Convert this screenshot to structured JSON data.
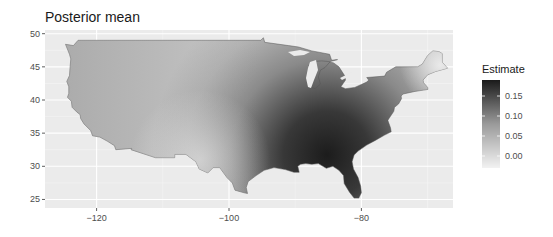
{
  "chart_data": {
    "type": "heatmap",
    "subtype": "choropleth-map",
    "title": "Posterior mean",
    "xlabel": "",
    "ylabel": "",
    "x_ticks": [
      -120,
      -100,
      -80
    ],
    "y_ticks": [
      25,
      30,
      35,
      40,
      45,
      50
    ],
    "xlim": [
      -127,
      -65
    ],
    "ylim": [
      24,
      50.5
    ],
    "grid": true,
    "region": "Contiguous United States",
    "legend": {
      "title": "Estimate",
      "position": "right",
      "labels": [
        "0.15",
        "0.10",
        "0.05",
        "0.00"
      ],
      "values": [
        0.15,
        0.1,
        0.05,
        0.0
      ],
      "range": [
        -0.03,
        0.19
      ],
      "colors": {
        "low": "#f2f2f2",
        "high": "#1a1a1a"
      }
    },
    "spatial_pattern": [
      {
        "area": "Pacific Northwest",
        "lon": -120,
        "lat": 46,
        "estimate": 0.06
      },
      {
        "area": "California coast",
        "lon": -121,
        "lat": 37,
        "estimate": 0.04
      },
      {
        "area": "Great Basin",
        "lon": -115,
        "lat": 41,
        "estimate": 0.03
      },
      {
        "area": "Southwest",
        "lon": -110,
        "lat": 33,
        "estimate": 0.0
      },
      {
        "area": "Northern Plains",
        "lon": -100,
        "lat": 46,
        "estimate": 0.02
      },
      {
        "area": "West Texas",
        "lon": -102,
        "lat": 31,
        "estimate": -0.01
      },
      {
        "area": "Great Lakes",
        "lon": -86,
        "lat": 44,
        "estimate": 0.02
      },
      {
        "area": "New England",
        "lon": -70,
        "lat": 45,
        "estimate": -0.02
      },
      {
        "area": "Mid-Atlantic",
        "lon": -77,
        "lat": 39,
        "estimate": 0.07
      },
      {
        "area": "Mississippi Valley",
        "lon": -90,
        "lat": 33,
        "estimate": 0.13
      },
      {
        "area": "Georgia/Alabama",
        "lon": -84,
        "lat": 32,
        "estimate": 0.18
      },
      {
        "area": "Florida",
        "lon": -81.5,
        "lat": 28,
        "estimate": 0.14
      }
    ]
  }
}
